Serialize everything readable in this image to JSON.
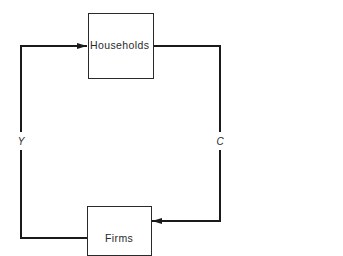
{
  "diagram": {
    "nodes": [
      {
        "id": "households",
        "label": "Households"
      },
      {
        "id": "firms",
        "label": "Firms"
      }
    ],
    "edges": [
      {
        "from": "firms",
        "to": "households",
        "label": "Y",
        "side": "left"
      },
      {
        "from": "households",
        "to": "firms",
        "label": "C",
        "side": "right"
      }
    ],
    "colors": {
      "line": "#1a1a1a",
      "text": "#2a2a2a",
      "background": "#ffffff"
    }
  }
}
